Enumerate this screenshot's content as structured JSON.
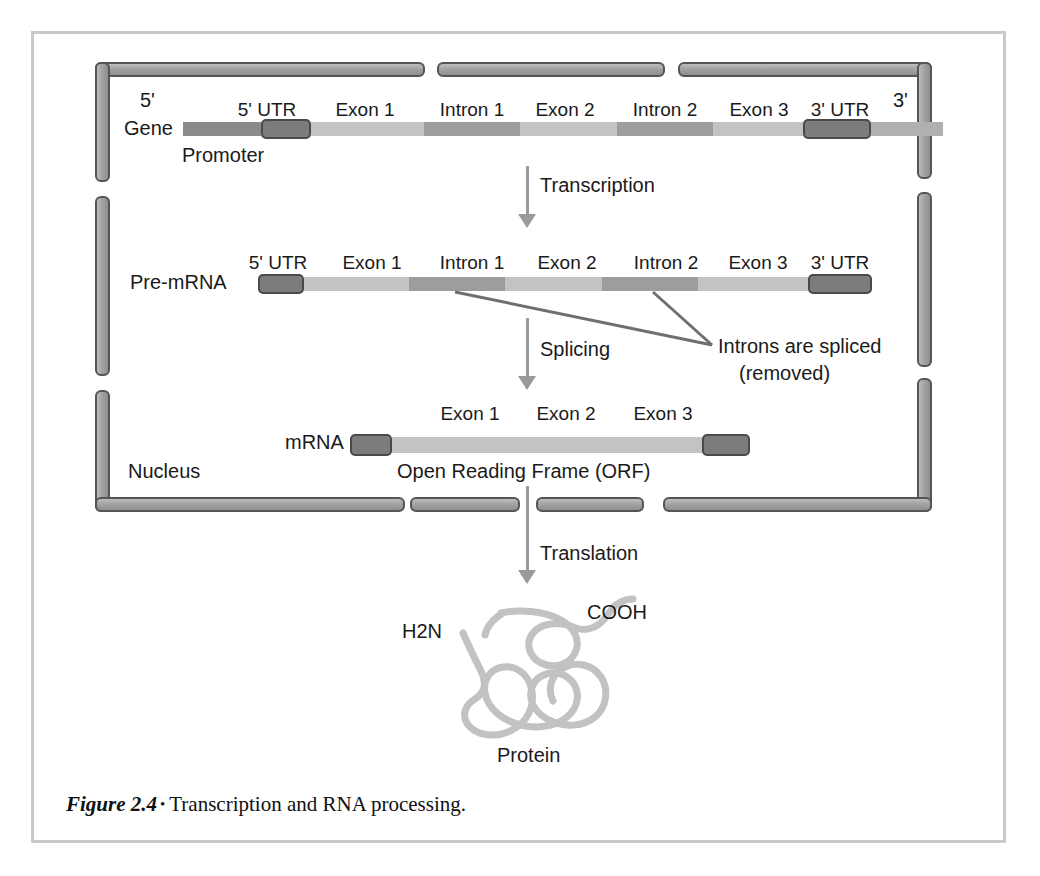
{
  "figure": {
    "caption_label": "Figure 2.4",
    "caption_bullet": "•",
    "caption_text": "Transcription and RNA processing."
  },
  "compartment": {
    "nucleus_label": "Nucleus"
  },
  "gene": {
    "row_label": "Gene",
    "five_prime": "5'",
    "three_prime": "3'",
    "promoter_label": "Promoter",
    "segments": [
      {
        "name": "promoter",
        "label": "",
        "type": "promoter"
      },
      {
        "name": "five-utr",
        "label": "5' UTR",
        "type": "utr"
      },
      {
        "name": "exon-1",
        "label": "Exon 1",
        "type": "exon"
      },
      {
        "name": "intron-1",
        "label": "Intron 1",
        "type": "intron"
      },
      {
        "name": "exon-2",
        "label": "Exon 2",
        "type": "exon"
      },
      {
        "name": "intron-2",
        "label": "Intron 2",
        "type": "intron"
      },
      {
        "name": "exon-3",
        "label": "Exon 3",
        "type": "exon"
      },
      {
        "name": "three-utr",
        "label": "3' UTR",
        "type": "utr"
      },
      {
        "name": "downstream",
        "label": "",
        "type": "tail"
      }
    ]
  },
  "pre_mrna": {
    "row_label": "Pre-mRNA",
    "segments": [
      {
        "name": "five-utr",
        "label": "5' UTR",
        "type": "utr"
      },
      {
        "name": "exon-1",
        "label": "Exon 1",
        "type": "exon"
      },
      {
        "name": "intron-1",
        "label": "Intron 1",
        "type": "intron"
      },
      {
        "name": "exon-2",
        "label": "Exon 2",
        "type": "exon"
      },
      {
        "name": "intron-2",
        "label": "Intron 2",
        "type": "intron"
      },
      {
        "name": "exon-3",
        "label": "Exon 3",
        "type": "exon"
      },
      {
        "name": "three-utr",
        "label": "3' UTR",
        "type": "utr"
      }
    ]
  },
  "mrna": {
    "row_label": "mRNA",
    "orf_label": "Open Reading Frame (ORF)",
    "segments": [
      {
        "name": "five-utr",
        "label": "",
        "type": "utr"
      },
      {
        "name": "exon-1",
        "label": "Exon 1",
        "type": "exon"
      },
      {
        "name": "exon-2",
        "label": "Exon 2",
        "type": "exon"
      },
      {
        "name": "exon-3",
        "label": "Exon 3",
        "type": "exon"
      },
      {
        "name": "three-utr",
        "label": "",
        "type": "utr"
      }
    ]
  },
  "arrows": {
    "transcription": "Transcription",
    "splicing": "Splicing",
    "translation": "Translation"
  },
  "annotations": {
    "splice_note_line1": "Introns are spliced",
    "splice_note_line2": "(removed)"
  },
  "protein": {
    "n_terminus": "H2N",
    "c_terminus": "COOH",
    "label": "Protein"
  },
  "colors": {
    "membrane_fill": "#a8a8a8",
    "membrane_stroke": "#555555",
    "promoter": "#8a8a8a",
    "exon": "#c3c3c3",
    "intron": "#9d9d9d",
    "utr": "#7c7c7c",
    "utr_stroke": "#4a4a4a",
    "arrow": "#9a9a9a",
    "protein": "#c0c0c0",
    "frame": "#c9c9c9",
    "text": "#1a1a1a"
  }
}
